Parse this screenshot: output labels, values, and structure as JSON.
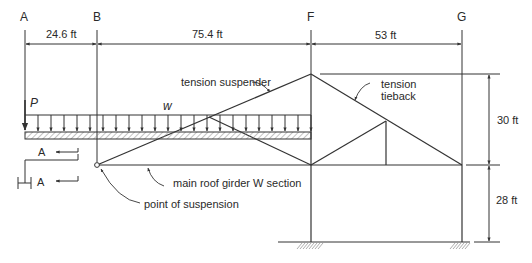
{
  "diagram": {
    "gridlines": [
      {
        "id": "A",
        "label": "A"
      },
      {
        "id": "B",
        "label": "B"
      },
      {
        "id": "F",
        "label": "F"
      },
      {
        "id": "G",
        "label": "G"
      }
    ],
    "dimensions": {
      "ab": "24.6 ft",
      "bf": "75.4 ft",
      "fg": "53 ft",
      "upper_height": "30 ft",
      "lower_height": "28 ft"
    },
    "loads": {
      "point_load": "P",
      "distributed_load": "w"
    },
    "section_marks": {
      "upper": "A",
      "lower": "A"
    },
    "callouts": {
      "tension_suspender": "tension suspender",
      "tension_tieback_line1": "tension",
      "tension_tieback_line2": "tieback",
      "main_girder": "main roof girder W section",
      "point_of_suspension": "point of suspension"
    },
    "colors": {
      "line": "#333333",
      "text": "#2a2a2a",
      "hatch": "#888888"
    }
  }
}
